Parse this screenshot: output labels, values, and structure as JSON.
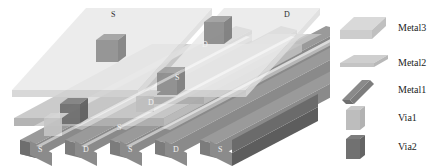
{
  "diagram": {
    "top_labels": [
      {
        "text": "S",
        "x": 111,
        "y": 11
      },
      {
        "text": "D",
        "x": 284,
        "y": 11
      }
    ],
    "mid_labels": [
      {
        "text": "D",
        "x": 202,
        "y": 41
      },
      {
        "text": "S",
        "x": 175,
        "y": 74
      },
      {
        "text": "D",
        "x": 148,
        "y": 99
      },
      {
        "text": "S",
        "x": 117,
        "y": 124
      }
    ],
    "bottom_labels": [
      {
        "text": "S",
        "x": 38,
        "y": 146
      },
      {
        "text": "D",
        "x": 83,
        "y": 146
      },
      {
        "text": "S",
        "x": 128,
        "y": 146
      },
      {
        "text": "D",
        "x": 173,
        "y": 146
      },
      {
        "text": "S",
        "x": 218,
        "y": 146
      }
    ],
    "colors": {
      "metal3_top": "#e9e9e9",
      "metal3_side": "#d2d2d2",
      "metal2_top": "#c8c8c8",
      "metal2_side": "#b0b0b0",
      "metal1_top": "#8f8f8f",
      "metal1_side": "#7c7c7c",
      "metal1_front": "#9a9a9a",
      "via1": "#c4c4c4",
      "via2": "#6f6f6f",
      "base_dark": "#5d5d5d",
      "label_dark": "#2b2b2b",
      "label_light": "#f2f2f2"
    }
  },
  "legend": {
    "items": [
      {
        "label": "Metal3",
        "icon": "metal3-slab-icon",
        "swatch_top": "#d9d9d9",
        "swatch_side": "#c0c0c0",
        "swatch_front": "#cdcdcd"
      },
      {
        "label": "Metal2",
        "icon": "metal2-slab-icon",
        "swatch_top": "#cfcfcf",
        "swatch_side": "#b8b8b8",
        "swatch_front": "#c4c4c4"
      },
      {
        "label": "Metal1",
        "icon": "metal1-bar-icon",
        "swatch_top": "#8a8a8a",
        "swatch_side": "#6f6f6f",
        "swatch_front": "#7d7d7d"
      },
      {
        "label": "Via1",
        "icon": "via1-cube-icon",
        "swatch_top": "#c9c9c9",
        "swatch_side": "#b2b2b2",
        "swatch_front": "#bdbdbd"
      },
      {
        "label": "Via2",
        "icon": "via2-cube-icon",
        "swatch_top": "#7d7d7d",
        "swatch_side": "#646464",
        "swatch_front": "#717171"
      }
    ]
  }
}
